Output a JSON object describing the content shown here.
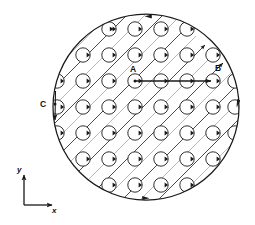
{
  "figure": {
    "type": "physics-schematic",
    "background_color": "#ffffff",
    "line_color": "#1a1a1a",
    "hatch_color": "#9a9a9a",
    "boundary": {
      "name": "sample-boundary-circle",
      "cx": 146,
      "cy": 107,
      "r": 94,
      "stroke_width": 1.2,
      "circulation": "counterclockwise",
      "arrow_positions_deg": [
        92,
        272,
        2,
        182
      ]
    },
    "vortex_lattice": {
      "name": "vortex-lattice",
      "radius": 7.2,
      "spacing_x": 26,
      "spacing_y": 26,
      "origin_x": 57,
      "origin_y": 29,
      "columns": 8,
      "rows": 8,
      "circulation": "clockwise",
      "count_label": ""
    },
    "hatching": {
      "name": "diagonal-flux-lines",
      "angle_deg": 45,
      "spacing": 18,
      "arrow_count": 6,
      "direction": "up-right"
    },
    "labels": [
      {
        "id": "A",
        "text": "A",
        "x": 132,
        "y": 72,
        "point_x": 135,
        "point_y": 81
      },
      {
        "id": "B",
        "text": "B",
        "x": 216,
        "y": 71,
        "point_x": 213,
        "point_y": 81
      },
      {
        "id": "C",
        "text": "C",
        "x": 43,
        "y": 104,
        "point_x": 55,
        "point_y": 104
      }
    ],
    "displacement_arrow": {
      "name": "displacement-arrow-ab",
      "from_label": "A",
      "to_label": "B",
      "x1": 135,
      "y1": 81,
      "x2": 213,
      "y2": 81,
      "stroke_width": 1.4
    },
    "edge_arrow_c": {
      "name": "edge-current-arrow-c",
      "x": 56,
      "y_top": 91,
      "y_bottom": 121,
      "direction": "down"
    },
    "axes": {
      "name": "coordinate-axes",
      "origin_x": 24,
      "origin_y": 205,
      "x_label": "x",
      "y_label": "y",
      "x_length": 30,
      "y_length": 32,
      "x_label_pos": {
        "x": 54,
        "y": 212
      },
      "y_label_pos": {
        "x": 18,
        "y": 170
      }
    }
  }
}
